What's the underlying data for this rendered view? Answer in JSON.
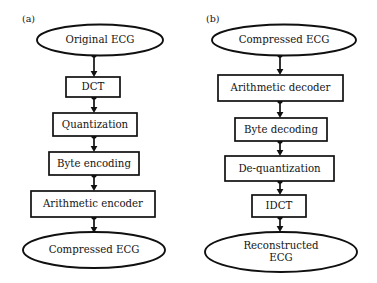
{
  "figure": {
    "background_color": "#ffffff",
    "line_color": "#101010",
    "text_color": "#141414",
    "width": 377,
    "height": 283
  },
  "panels": [
    {
      "id": "panel-a",
      "label": "(a)",
      "label_x": 22,
      "label_y": 19,
      "nodes": [
        {
          "id": "a-original-ecg",
          "name": "original-ecg",
          "text": "Original ECG",
          "shape": "ellipse",
          "cx": 100,
          "cy": 40,
          "rx": 63,
          "ry": 15.5,
          "font_size": 10.2
        },
        {
          "id": "a-dct",
          "name": "dct",
          "text": "DCT",
          "shape": "rectangle",
          "x": 66,
          "y": 77,
          "w": 54,
          "h": 20,
          "font_size": 10.2
        },
        {
          "id": "a-quantization",
          "name": "quantization",
          "text": "Quantization",
          "shape": "rectangle",
          "x": 53,
          "y": 113,
          "w": 84,
          "h": 23,
          "font_size": 10.2
        },
        {
          "id": "a-byte-encoding",
          "name": "byte-encoding",
          "text": "Byte encoding",
          "shape": "rectangle",
          "x": 49,
          "y": 152,
          "w": 90,
          "h": 23,
          "font_size": 10.2
        },
        {
          "id": "a-arithmetic-encoder",
          "name": "arithmetic-encoder",
          "text": "Arithmetic encoder",
          "shape": "rectangle",
          "x": 31,
          "y": 191,
          "w": 124,
          "h": 26,
          "font_size": 10.2
        },
        {
          "id": "a-compressed-ecg",
          "name": "compressed-ecg",
          "text": "Compressed ECG",
          "shape": "ellipse",
          "cx": 94,
          "cy": 250,
          "rx": 71,
          "ry": 18,
          "font_size": 10.2
        }
      ],
      "connectors": [
        {
          "from": "a-original-ecg",
          "to": "a-dct",
          "x": 94,
          "y1": 55,
          "y2": 77
        },
        {
          "from": "a-dct",
          "to": "a-quantization",
          "x": 94,
          "y1": 97,
          "y2": 113
        },
        {
          "from": "a-quantization",
          "to": "a-byte-encoding",
          "x": 94,
          "y1": 136,
          "y2": 152
        },
        {
          "from": "a-byte-encoding",
          "to": "a-arithmetic-encoder",
          "x": 94,
          "y1": 175,
          "y2": 191
        },
        {
          "from": "a-arithmetic-encoder",
          "to": "a-compressed-ecg",
          "x": 94,
          "y1": 217,
          "y2": 233
        }
      ]
    },
    {
      "id": "panel-b",
      "label": "(b)",
      "label_x": 206,
      "label_y": 19,
      "nodes": [
        {
          "id": "b-compressed-ecg",
          "name": "compressed-ecg",
          "text": "Compressed ECG",
          "shape": "ellipse",
          "cx": 284,
          "cy": 40,
          "rx": 72,
          "ry": 15.5,
          "font_size": 10.2
        },
        {
          "id": "b-arithmetic-decoder",
          "name": "arithmetic-decoder",
          "text": "Arithmetic decoder",
          "shape": "rectangle",
          "x": 218,
          "y": 75,
          "w": 125,
          "h": 26,
          "font_size": 10.2
        },
        {
          "id": "b-byte-decoding",
          "name": "byte-decoding",
          "text": "Byte decoding",
          "shape": "rectangle",
          "x": 235,
          "y": 118,
          "w": 92,
          "h": 23,
          "font_size": 10.2
        },
        {
          "id": "b-de-quantization",
          "name": "de-quantization",
          "text": "De-quantization",
          "shape": "rectangle",
          "x": 225,
          "y": 156,
          "w": 109,
          "h": 25,
          "font_size": 10.2
        },
        {
          "id": "b-idct",
          "name": "idct",
          "text": "IDCT",
          "shape": "rectangle",
          "x": 252,
          "y": 195,
          "w": 54,
          "h": 22,
          "font_size": 10.2
        },
        {
          "id": "b-reconstructed-ecg",
          "name": "reconstructed-ecg",
          "text": "Reconstructed ECG",
          "text_line1": "Reconstructed",
          "text_line2": "ECG",
          "shape": "ellipse",
          "cx": 281,
          "cy": 252,
          "rx": 76,
          "ry": 20,
          "font_size": 10.2
        }
      ],
      "connectors": [
        {
          "from": "b-compressed-ecg",
          "to": "b-arithmetic-decoder",
          "x": 280,
          "y1": 55,
          "y2": 75
        },
        {
          "from": "b-arithmetic-decoder",
          "to": "b-byte-decoding",
          "x": 280,
          "y1": 101,
          "y2": 118
        },
        {
          "from": "b-byte-decoding",
          "to": "b-de-quantization",
          "x": 280,
          "y1": 141,
          "y2": 156
        },
        {
          "from": "b-de-quantization",
          "to": "b-idct",
          "x": 280,
          "y1": 181,
          "y2": 195
        },
        {
          "from": "b-idct",
          "to": "b-reconstructed-ecg",
          "x": 280,
          "y1": 217,
          "y2": 232
        }
      ]
    }
  ]
}
